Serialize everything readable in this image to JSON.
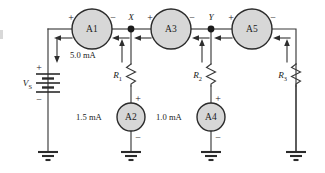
{
  "figure": {
    "background_color": "#ffffff",
    "wire_color": "#3a3a3a",
    "meter_fill_color": "#d7d7d7",
    "meter_stroke_color": "#2b2b2b"
  },
  "source": {
    "label": "V",
    "subscript": "S",
    "plus": "+",
    "minus": "−",
    "type": "battery"
  },
  "meters": [
    {
      "id": "A1",
      "label": "A1",
      "reading": "5.0 mA",
      "plus": "+",
      "minus": "−",
      "orientation": "horizontal",
      "position": "top-branch-1"
    },
    {
      "id": "A2",
      "label": "A2",
      "reading": "1.5 mA",
      "plus": "+",
      "minus": "−",
      "orientation": "vertical",
      "position": "branch-R1"
    },
    {
      "id": "A3",
      "label": "A3",
      "reading": "",
      "plus": "+",
      "minus": "−",
      "orientation": "horizontal",
      "position": "top-branch-2"
    },
    {
      "id": "A4",
      "label": "A4",
      "reading": "1.0 mA",
      "plus": "+",
      "minus": "−",
      "orientation": "vertical",
      "position": "branch-R2"
    },
    {
      "id": "A5",
      "label": "A5",
      "reading": "",
      "plus": "+",
      "minus": "−",
      "orientation": "horizontal",
      "position": "top-branch-3"
    }
  ],
  "resistors": [
    {
      "id": "R1",
      "label": "R",
      "subscript": "1",
      "branch": "node-X"
    },
    {
      "id": "R2",
      "label": "R",
      "subscript": "2",
      "branch": "node-Y"
    },
    {
      "id": "R3",
      "label": "R",
      "subscript": "3",
      "branch": "right"
    }
  ],
  "nodes": [
    {
      "id": "X",
      "label": "X"
    },
    {
      "id": "Y",
      "label": "Y"
    }
  ],
  "readings": {
    "a1_current": "5.0 mA",
    "a2_current": "1.5 mA",
    "a4_current": "1.0 mA"
  },
  "grounds": [
    {
      "id": "gnd-source"
    },
    {
      "id": "gnd-a2"
    },
    {
      "id": "gnd-a4"
    },
    {
      "id": "gnd-r3"
    }
  ],
  "polarity_marks": {
    "plus": "+",
    "minus": "−"
  }
}
